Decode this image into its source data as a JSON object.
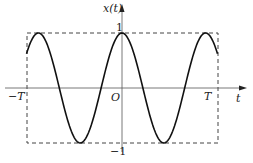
{
  "chart_data": {
    "type": "line",
    "title": "",
    "xlabel": "t",
    "ylabel": "x(t)",
    "function": "cos(2*pi*t/P), P = 0.875T",
    "x_tick_labels": [
      "-T",
      "O",
      "T"
    ],
    "y_tick_labels": [
      "1",
      "-1"
    ],
    "xlim": [
      "-T",
      "T"
    ],
    "ylim": [
      -1,
      1
    ],
    "grid": false,
    "legend": null,
    "annotations": [
      "dashed bounding box from -T to T, -1 to 1"
    ],
    "series": [
      {
        "name": "x(t)",
        "x": [
          -1.0,
          -0.875,
          -0.656,
          -0.4375,
          -0.219,
          0.0,
          0.219,
          0.4375,
          0.656,
          0.875,
          1.0
        ],
        "values": [
          0.62,
          1.0,
          0.0,
          -1.0,
          0.0,
          1.0,
          0.0,
          -1.0,
          0.0,
          1.0,
          0.62
        ]
      }
    ]
  },
  "labels": {
    "ylabel": "x(t)",
    "xlabel": "t",
    "neg_T": "−T",
    "origin": "O",
    "pos_T": "T",
    "one": "1",
    "neg_one": "−1"
  }
}
